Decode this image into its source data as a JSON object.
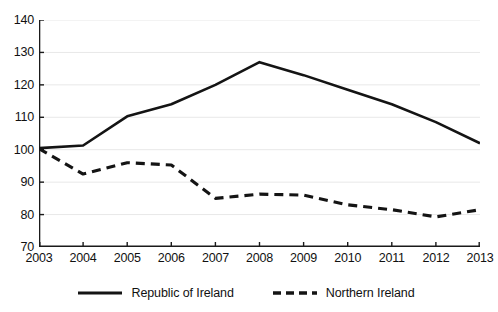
{
  "chart_data": {
    "type": "line",
    "title": "",
    "subtitle": "",
    "xlabel": "",
    "ylabel": "",
    "categories": [
      "2003",
      "2004",
      "2005",
      "2006",
      "2007",
      "2008",
      "2009",
      "2010",
      "2011",
      "2012",
      "2013"
    ],
    "x": [
      2003,
      2004,
      2005,
      2006,
      2007,
      2008,
      2009,
      2010,
      2011,
      2012,
      2013
    ],
    "xlim": [
      2003,
      2013
    ],
    "ylim": [
      70,
      140
    ],
    "y_ticks": [
      70,
      80,
      90,
      100,
      110,
      120,
      130,
      140
    ],
    "grid": true,
    "legend_position": "bottom",
    "series": [
      {
        "name": "Republic of Ireland",
        "style": "solid",
        "color": "#141414",
        "values": [
          100.5,
          101.3,
          110.3,
          114.0,
          120.0,
          127.0,
          123.0,
          118.5,
          114.0,
          108.5,
          102.0
        ]
      },
      {
        "name": "Northern Ireland",
        "style": "dashed",
        "color": "#141414",
        "values": [
          100.3,
          92.5,
          96.0,
          95.3,
          85.0,
          86.3,
          86.0,
          83.0,
          81.5,
          79.3,
          81.5
        ]
      }
    ]
  },
  "axes": {
    "y_tick_labels": [
      "140",
      "130",
      "120",
      "110",
      "100",
      "90",
      "80",
      "70"
    ],
    "x_tick_labels": [
      "2003",
      "2004",
      "2005",
      "2006",
      "2007",
      "2008",
      "2009",
      "2010",
      "2011",
      "2012",
      "2013"
    ]
  },
  "legend": {
    "entries": [
      {
        "label": "Republic of Ireland",
        "style": "solid"
      },
      {
        "label": "Northern Ireland",
        "style": "dashed"
      }
    ]
  },
  "colors": {
    "line": "#141414",
    "axis": "#1a1a1a",
    "grid": "#e8e8e8",
    "background": "#ffffff"
  }
}
